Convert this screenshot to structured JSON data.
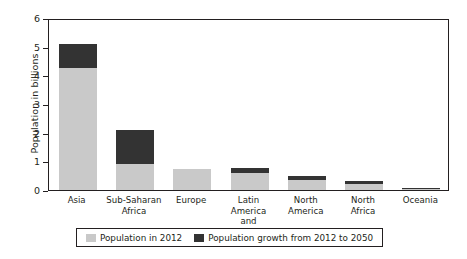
{
  "chart_data": {
    "type": "bar",
    "subtype": "stacked-bar",
    "title": "",
    "xlabel": "",
    "ylabel": "Population in billions",
    "ylim": [
      0,
      6
    ],
    "yticks": [
      0,
      1,
      2,
      3,
      4,
      5,
      6
    ],
    "ytick_labels": [
      "0",
      "1",
      "2",
      "3",
      "4",
      "5",
      "6"
    ],
    "grid": false,
    "legend_position": "bottom",
    "categories": [
      "Asia",
      "Sub-Saharan\nAfrica",
      "Europe",
      "Latin America\nand Caribbean",
      "North\nAmerica",
      "North\nAfrica",
      "Oceania"
    ],
    "series": [
      {
        "name": "Population in 2012",
        "color": "#c9c9c9",
        "values": [
          4.25,
          0.9,
          0.74,
          0.61,
          0.35,
          0.21,
          0.04
        ]
      },
      {
        "name": "Population growth from 2012 to 2050",
        "color": "#333333",
        "values": [
          0.85,
          1.2,
          0.0,
          0.17,
          0.15,
          0.11,
          0.02
        ]
      }
    ],
    "totals": [
      5.1,
      2.1,
      0.74,
      0.78,
      0.5,
      0.32,
      0.06
    ],
    "annotations": []
  },
  "colors": {
    "base": "#c9c9c9",
    "growth": "#333333",
    "axis": "#231f20",
    "background": "#ffffff"
  }
}
